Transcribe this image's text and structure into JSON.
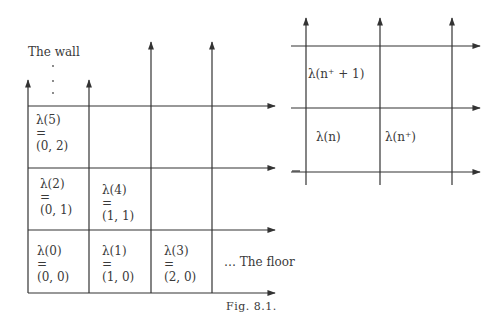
{
  "figure": {
    "caption": "Fig. 8.1.",
    "left_diagram": {
      "wall_label": "The wall",
      "floor_label": "… The floor",
      "cells": [
        {
          "lambda": "λ(5)",
          "eq": "=",
          "coord": "(0, 2)"
        },
        {
          "lambda": "λ(2)",
          "eq": "=",
          "coord": "(0, 1)"
        },
        {
          "lambda": "λ(4)",
          "eq": "=",
          "coord": "(1, 1)"
        },
        {
          "lambda": "λ(0)",
          "eq": "=",
          "coord": "(0, 0)"
        },
        {
          "lambda": "λ(1)",
          "eq": "=",
          "coord": "(1, 0)"
        },
        {
          "lambda": "λ(3)",
          "eq": "=",
          "coord": "(2, 0)"
        }
      ]
    },
    "right_diagram": {
      "cells": [
        {
          "label": "λ(n⁺ + 1)"
        },
        {
          "label": "λ(n)"
        },
        {
          "label": "λ(n⁺)"
        }
      ]
    }
  }
}
